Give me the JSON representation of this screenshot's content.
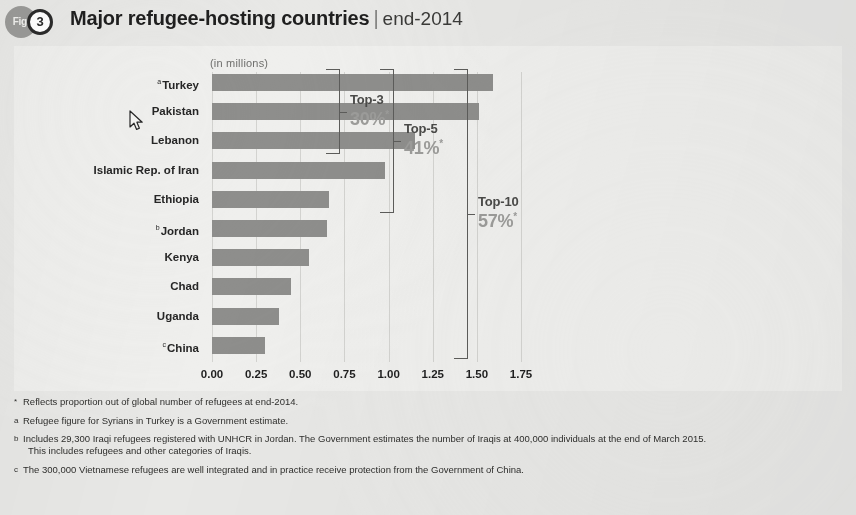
{
  "header": {
    "fig_label": "Fig.",
    "fig_number": "3",
    "title": "Major refugee-hosting countries",
    "separator": "|",
    "subtitle": "end-2014"
  },
  "chart_data": {
    "type": "bar",
    "orientation": "horizontal",
    "subtitle": "(in millions)",
    "units_label": "(in millions)",
    "xlabel": "",
    "ylabel": "",
    "xlim": [
      0.0,
      1.9
    ],
    "xticks": [
      "0.00",
      "0.25",
      "0.50",
      "0.75",
      "1.00",
      "1.25",
      "1.50",
      "1.75"
    ],
    "xtick_values": [
      0.0,
      0.25,
      0.5,
      0.75,
      1.0,
      1.25,
      1.5,
      1.75
    ],
    "grid": true,
    "legend": "none",
    "bar_color": "#8e8e8c",
    "categories": [
      "Turkey",
      "Pakistan",
      "Lebanon",
      "Islamic Rep. of Iran",
      "Ethiopia",
      "Jordan",
      "Kenya",
      "Chad",
      "Uganda",
      "China"
    ],
    "category_marks": [
      "a",
      "",
      "",
      "",
      "",
      "b",
      "",
      "",
      "",
      "c"
    ],
    "values": [
      1.59,
      1.51,
      1.15,
      0.98,
      0.66,
      0.65,
      0.55,
      0.45,
      0.38,
      0.3
    ],
    "annotations": [
      {
        "label": "Top-3",
        "value": "30%",
        "mark": "*",
        "covers": [
          "Turkey",
          "Pakistan",
          "Lebanon"
        ]
      },
      {
        "label": "Top-5",
        "value": "41%",
        "mark": "*",
        "covers": [
          "Turkey",
          "Pakistan",
          "Lebanon",
          "Islamic Rep. of Iran",
          "Ethiopia"
        ]
      },
      {
        "label": "Top-10",
        "value": "57%",
        "mark": "*",
        "covers": [
          "Turkey",
          "Pakistan",
          "Lebanon",
          "Islamic Rep. of Iran",
          "Ethiopia",
          "Jordan",
          "Kenya",
          "Chad",
          "Uganda",
          "China"
        ]
      }
    ]
  },
  "footnotes": [
    {
      "mark": "*",
      "text": "Reflects proportion out of global number of refugees at end-2014.",
      "continuation": ""
    },
    {
      "mark": "a",
      "text": "Refugee figure for Syrians in Turkey is a Government estimate.",
      "continuation": ""
    },
    {
      "mark": "b",
      "text": "Includes 29,300 Iraqi refugees registered with UNHCR in Jordan. The Government estimates the number of Iraqis at 400,000 individuals at the end of March 2015.",
      "continuation": "This includes refugees and other categories of Iraqis."
    },
    {
      "mark": "c",
      "text": "The 300,000 Vietnamese refugees are well integrated and in practice receive protection from the Government of China.",
      "continuation": ""
    }
  ],
  "cursor": {
    "icon": "mouse-pointer",
    "x": 133,
    "y": 118
  }
}
